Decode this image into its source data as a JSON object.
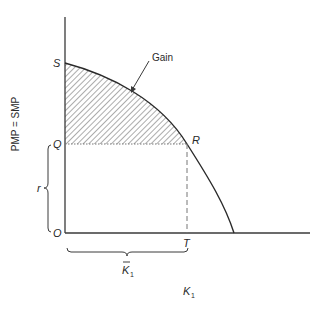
{
  "diagram": {
    "y_axis_label": "PMP = SMP",
    "x_axis_label": "K",
    "x_axis_label_sub": "1",
    "points": {
      "S": "S",
      "Q": "Q",
      "O": "O",
      "R": "R",
      "T": "T"
    },
    "annotations": {
      "gain": "Gain",
      "r": "r",
      "k_bar": "K",
      "k_bar_sub": "1"
    },
    "colors": {
      "line": "#3a3a3a",
      "hatch": "#5a5a5a",
      "background": "#ffffff"
    }
  }
}
